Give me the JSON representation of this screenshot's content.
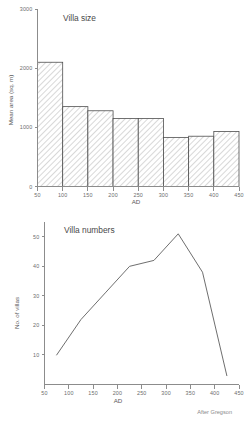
{
  "figure": {
    "credit": "After Gregson",
    "bottom_cut_text": ""
  },
  "chart_data": [
    {
      "type": "bar",
      "title": "Villa size",
      "xlabel": "AD",
      "ylabel": "Mean area (sq. m)",
      "xlim": [
        50,
        450
      ],
      "ylim": [
        0,
        3000
      ],
      "xticks": [
        50,
        100,
        150,
        200,
        250,
        300,
        350,
        400,
        450
      ],
      "xtick_labels": [
        "50",
        "100",
        "150",
        "200",
        "250",
        "300",
        "350",
        "400",
        "450"
      ],
      "yticks": [
        0,
        1000,
        2000,
        3000
      ],
      "ytick_labels": [
        "0",
        "1000",
        "2000",
        "3000"
      ],
      "grid": false,
      "bar_fill": "hatched",
      "bin_edges": [
        50,
        100,
        150,
        200,
        250,
        300,
        350,
        400,
        450
      ],
      "categories": [
        "50-100",
        "100-150",
        "150-200",
        "200-250",
        "250-300",
        "300-350",
        "350-400",
        "400-450"
      ],
      "values": [
        2100,
        1350,
        1280,
        1150,
        1150,
        830,
        850,
        930
      ]
    },
    {
      "type": "line",
      "title": "Villa numbers",
      "xlabel": "AD",
      "ylabel": "No. of villas",
      "xlim": [
        50,
        450
      ],
      "ylim": [
        0,
        55
      ],
      "xticks": [
        50,
        100,
        150,
        200,
        250,
        300,
        350,
        400,
        450
      ],
      "xtick_labels": [
        "50",
        "100",
        "150",
        "200",
        "250",
        "300",
        "350",
        "400",
        "450"
      ],
      "yticks": [
        10,
        20,
        30,
        40,
        50
      ],
      "ytick_labels": [
        "10",
        "20",
        "30",
        "40",
        "50"
      ],
      "grid": false,
      "legend": null,
      "series": [
        {
          "name": "Villa numbers",
          "x": [
            75,
            125,
            175,
            225,
            275,
            325,
            375,
            425
          ],
          "values": [
            10,
            22,
            31,
            40,
            42,
            51,
            38,
            3
          ]
        }
      ]
    }
  ]
}
